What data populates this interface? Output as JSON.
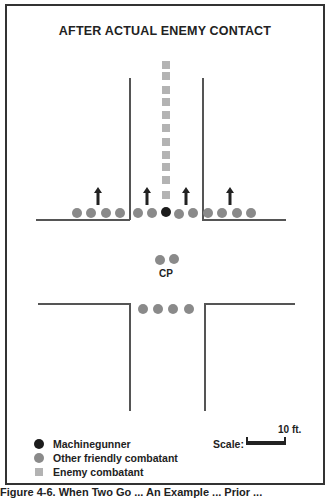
{
  "diagram": {
    "title": "AFTER ACTUAL ENEMY CONTACT",
    "cp_label": "CP",
    "colors": {
      "machinegunner": "#1c1c1c",
      "friendly": "#8a8a8a",
      "enemy": "#b3b3b3",
      "street_lines": "#555555"
    },
    "enemy_column_count": 11,
    "top_row_friendly_left_count": 4,
    "top_row_friendly_center_count": 4,
    "top_row_friendly_right_count": 4,
    "arrows_count": 4,
    "cp_dot_count": 2,
    "bottom_row_friendly_count": 4
  },
  "legend": {
    "items": [
      {
        "label": "Machinegunner",
        "symbol": "black-circle"
      },
      {
        "label": "Other friendly combatant",
        "symbol": "gray-circle"
      },
      {
        "label": "Enemy combatant",
        "symbol": "light-gray-square"
      }
    ],
    "scale_label": "Scale:",
    "scale_unit": "10 ft."
  },
  "caption": "Figure 4-6.  When Two Go ...  An Example ... Prior ..."
}
